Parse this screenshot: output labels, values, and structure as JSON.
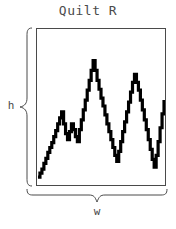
{
  "figure": {
    "title": "Quilt R",
    "height_label": "h",
    "width_label": "w",
    "stroke_color": "#000000",
    "frame_color": "#4a4a4a",
    "text_color": "#4a4a4a",
    "background": "#ffffff"
  },
  "chart_data": {
    "type": "line",
    "title": "Quilt R",
    "xlabel": "w",
    "ylabel": "h",
    "grid": false,
    "legend": null,
    "xlim": [
      0,
      130
    ],
    "ylim": [
      0,
      158
    ],
    "step_style": "staircase",
    "series": [
      {
        "name": "quilt-profile",
        "x": [
          1,
          3,
          5,
          7,
          9,
          11,
          13,
          15,
          17,
          19,
          21,
          23,
          25,
          27,
          29,
          31,
          33,
          35,
          37,
          39,
          41,
          43,
          45,
          47,
          49,
          51,
          53,
          55,
          57,
          59,
          61,
          63,
          65,
          67,
          69,
          71,
          73,
          75,
          77,
          79,
          81,
          83,
          85,
          87,
          89,
          91,
          93,
          95,
          97,
          99,
          101,
          103,
          105,
          107,
          109,
          111,
          113,
          115,
          117,
          119,
          121,
          123,
          125,
          127,
          129
        ],
        "y": [
          8,
          12,
          16,
          22,
          27,
          33,
          38,
          43,
          49,
          55,
          62,
          68,
          74,
          62,
          52,
          46,
          54,
          62,
          56,
          49,
          44,
          56,
          66,
          76,
          86,
          96,
          106,
          116,
          126,
          116,
          106,
          97,
          88,
          80,
          71,
          62,
          54,
          46,
          38,
          30,
          24,
          34,
          44,
          54,
          64,
          74,
          84,
          94,
          104,
          112,
          104,
          96,
          86,
          76,
          66,
          56,
          46,
          36,
          26,
          18,
          30,
          44,
          58,
          72,
          86
        ]
      }
    ],
    "peaks": [
      {
        "x": 25,
        "y": 74,
        "label": "first-minor-peak"
      },
      {
        "x": 45,
        "y": 66,
        "label": "second-minor-peak"
      },
      {
        "x": 57,
        "y": 126,
        "label": "main-peak"
      },
      {
        "x": 99,
        "y": 112,
        "label": "third-peak"
      }
    ],
    "valleys": [
      {
        "x": 31,
        "y": 46,
        "label": "first-valley"
      },
      {
        "x": 79,
        "y": 30,
        "label": "deep-valley"
      },
      {
        "x": 119,
        "y": 18,
        "label": "deepest-valley"
      }
    ]
  }
}
